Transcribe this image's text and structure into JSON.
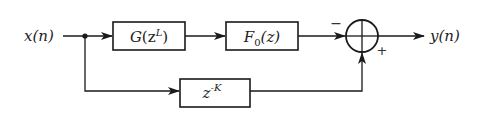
{
  "diagram": {
    "type": "block-diagram",
    "input": {
      "label": "x(n)"
    },
    "output": {
      "label": "y(n)"
    },
    "blocks": [
      {
        "id": "G",
        "name": "G",
        "arg": "(z",
        "sup": "L",
        "close": ")"
      },
      {
        "id": "F0",
        "name": "F",
        "sub": "0",
        "arg": "(z)"
      },
      {
        "id": "delay",
        "base": "z",
        "sup": "-K"
      }
    ],
    "summing_junction": {
      "signs": {
        "top_input": "−",
        "bottom_input": "+"
      }
    },
    "connections": [
      {
        "from": "x(n)",
        "to": "G"
      },
      {
        "from": "G",
        "to": "F0"
      },
      {
        "from": "F0",
        "to": "sum",
        "sign": "−"
      },
      {
        "from": "x(n)",
        "to": "delay"
      },
      {
        "from": "delay",
        "to": "sum",
        "sign": "+"
      },
      {
        "from": "sum",
        "to": "y(n)"
      }
    ],
    "colors": {
      "stroke": "#1a1a1a",
      "background": "#ffffff"
    }
  }
}
